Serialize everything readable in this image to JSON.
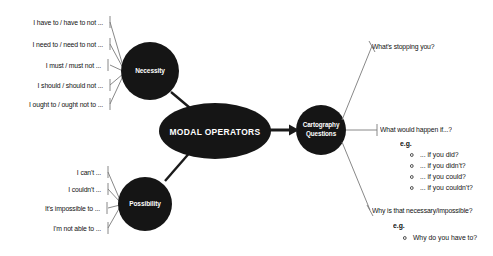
{
  "diagram": {
    "title_node": "MODAL OPERATORS",
    "colors": {
      "node_fill": "#151515",
      "text_on_node": "#ffffff",
      "line": "#6e6e6e",
      "arrow": "#1a1a1a",
      "background": "#ffffff",
      "body_text": "#111111"
    },
    "nodes": {
      "necessity": "Necessity",
      "possibility": "Possibility",
      "modal_operators": "MODAL OPERATORS",
      "cartography_line1": "Cartography",
      "cartography_line2": "Questions"
    },
    "necessity_items": [
      "I have to / have to not ...",
      "I need to / need to not ...",
      "I must / must not ...",
      "I should / should not ...",
      "I ought to / ought not to ..."
    ],
    "possibility_items": [
      "I can't ...",
      "I couldn't ...",
      "It's impossible to ...",
      "I'm not able to ..."
    ],
    "questions": [
      {
        "heading": "What's stopping you?",
        "eg_label": "",
        "examples": []
      },
      {
        "heading": "What would happen if...?",
        "eg_label": "e.g.",
        "examples": [
          "... if you did?",
          "... if you didn't?",
          "... if you could?",
          "... if you couldn't?"
        ]
      },
      {
        "heading": "Why is that necessary/impossible?",
        "eg_label": "e.g.",
        "examples": [
          "Why do you have to?"
        ]
      }
    ]
  }
}
